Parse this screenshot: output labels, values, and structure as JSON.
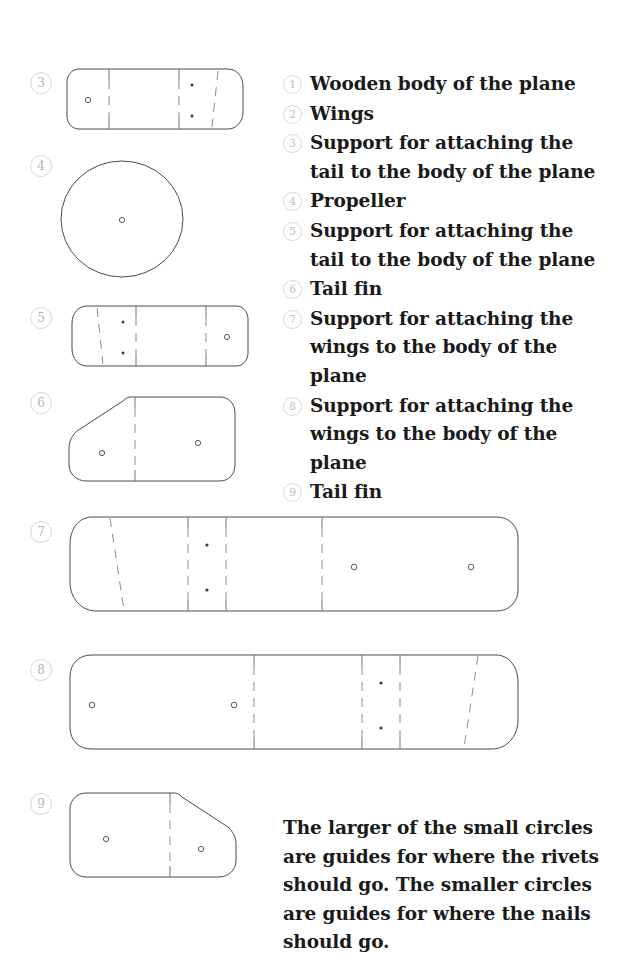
{
  "document": {
    "title": "Wooden plane parts template"
  },
  "legend": {
    "items": [
      {
        "number": "1",
        "label": "Wooden body of the plane"
      },
      {
        "number": "2",
        "label": "Wings"
      },
      {
        "number": "3",
        "label": "Support for attaching the tail to the body of the plane"
      },
      {
        "number": "4",
        "label": "Propeller"
      },
      {
        "number": "5",
        "label": "Support for attaching the tail to the body of the plane"
      },
      {
        "number": "6",
        "label": "Tail fin"
      },
      {
        "number": "7",
        "label": "Support for attaching the wings to the body of the plane"
      },
      {
        "number": "8",
        "label": "Support for attaching the wings to the body of the plane"
      },
      {
        "number": "9",
        "label": "Tail fin"
      }
    ]
  },
  "parts": [
    {
      "number": "3",
      "name": "tail-support-left"
    },
    {
      "number": "4",
      "name": "propeller-disc"
    },
    {
      "number": "5",
      "name": "tail-support-right"
    },
    {
      "number": "6",
      "name": "tail-fin-left"
    },
    {
      "number": "7",
      "name": "wing-support-left"
    },
    {
      "number": "8",
      "name": "wing-support-right"
    },
    {
      "number": "9",
      "name": "tail-fin-right"
    }
  ],
  "note": {
    "text": "The larger of the small circles are guides for where the rivets should go. The smaller circles are guides for where the nails should go."
  },
  "colors": {
    "outline": "#4a4a4a",
    "fold_line": "#8d8d8d",
    "badge_border": "#d9d9d9",
    "badge_text": "#bdbdbd",
    "text": "#1a1a1a",
    "background": "#ffffff"
  }
}
